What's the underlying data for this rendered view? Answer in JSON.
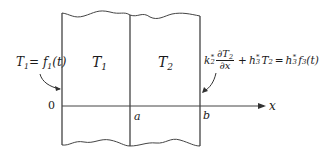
{
  "diagram": {
    "type": "two-layer slab heat conduction schematic",
    "regions": [
      {
        "id": "region-1",
        "label": "T",
        "subscript": "1"
      },
      {
        "id": "region-2",
        "label": "T",
        "subscript": "2"
      }
    ],
    "axis": {
      "origin_label": "0",
      "interface_label": "a",
      "outer_label": "b",
      "variable_label": "x"
    },
    "left_boundary_condition": {
      "lhs_var": "T",
      "lhs_sub": "1",
      "eq": "=",
      "rhs_fn": "f",
      "rhs_sub": "1",
      "rhs_arg": "(t)"
    },
    "right_boundary_condition": {
      "k": "k",
      "k_sub": "2",
      "k_sup": "*",
      "num_d": "∂T",
      "num_sub": "2",
      "den": "∂x",
      "plus": "+",
      "h": "h",
      "h_sub": "3",
      "h_sup": "*",
      "t": "T",
      "t_sub": "2",
      "eq": "=",
      "h2": "h",
      "h2_sub": "3",
      "h2_sup": "*",
      "fn": "f",
      "fn_sub": "3",
      "fn_arg": "(t)"
    },
    "colors": {
      "line": "#333333",
      "text": "#1a1a1a",
      "background": "#ffffff"
    }
  }
}
